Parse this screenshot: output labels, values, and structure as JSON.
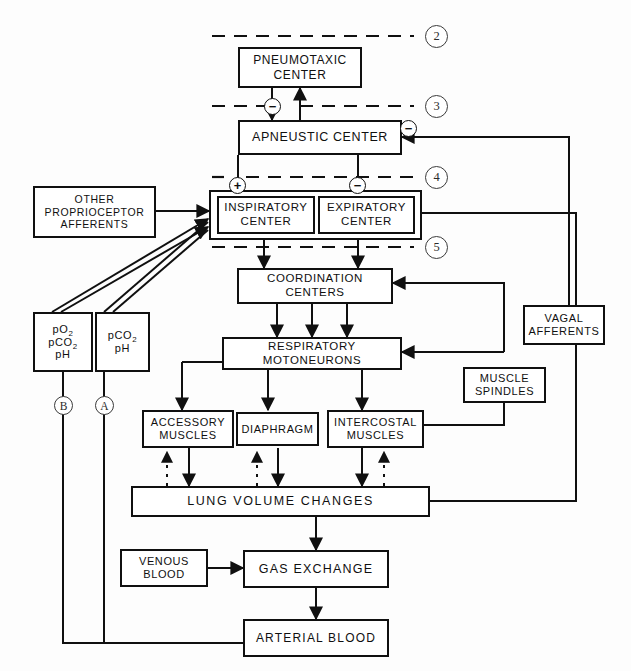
{
  "diagram": {
    "type": "flowchart",
    "line_color": "#101010",
    "background": "#fdfdfd"
  },
  "nodes": {
    "pneumotaxic": {
      "line1": "PNEUMOTAXIC",
      "line2": "CENTER"
    },
    "apneustic": {
      "line1": "APNEUSTIC CENTER",
      "line2": ""
    },
    "inspiratory": {
      "line1": "INSPIRATORY",
      "line2": "CENTER"
    },
    "expiratory": {
      "line1": "EXPIRATORY",
      "line2": "CENTER"
    },
    "proprioceptor": {
      "line1": "OTHER",
      "line2": "PROPRIOCEPTOR",
      "line3": "AFFERENTS"
    },
    "coordination": {
      "line1": "COORDINATION",
      "line2": "CENTERS"
    },
    "motoneurons": {
      "line1": "RESPIRATORY",
      "line2": "MOTONEURONS"
    },
    "chemo_b": {
      "line1": "pO",
      "sub1": "2",
      "line2": "pCO",
      "sub2": "2",
      "line3": "pH"
    },
    "chemo_a": {
      "line1": "pCO",
      "sub1": "2",
      "line2": "pH"
    },
    "accessory": {
      "line1": "ACCESSORY",
      "line2": "MUSCLES"
    },
    "diaphragm": {
      "line1": "DIAPHRAGM",
      "line2": ""
    },
    "intercostal": {
      "line1": "INTERCOSTAL",
      "line2": "MUSCLES"
    },
    "spindles": {
      "line1": "MUSCLE",
      "line2": "SPINDLES"
    },
    "vagal": {
      "line1": "VAGAL",
      "line2": "AFFERENTS"
    },
    "lung": {
      "line1": "LUNG   VOLUME   CHANGES",
      "line2": ""
    },
    "venous": {
      "line1": "VENOUS",
      "line2": "BLOOD"
    },
    "gas": {
      "line1": "GAS  EXCHANGE",
      "line2": ""
    },
    "arterial": {
      "line1": "ARTERIAL BLOOD",
      "line2": ""
    }
  },
  "level_markers": [
    {
      "id": "level-2",
      "label": "2"
    },
    {
      "id": "level-3",
      "label": "3"
    },
    {
      "id": "level-4",
      "label": "4"
    },
    {
      "id": "level-5",
      "label": "5"
    }
  ],
  "path_markers": [
    {
      "id": "path-b",
      "label": "B"
    },
    {
      "id": "path-a",
      "label": "A"
    }
  ],
  "sign_markers": [
    {
      "id": "sign-minus-pneumo-apneustic",
      "label": "−"
    },
    {
      "id": "sign-minus-vagal-apneustic",
      "label": "−"
    },
    {
      "id": "sign-plus-inspiratory",
      "label": "+"
    },
    {
      "id": "sign-minus-expiratory",
      "label": "−"
    }
  ]
}
